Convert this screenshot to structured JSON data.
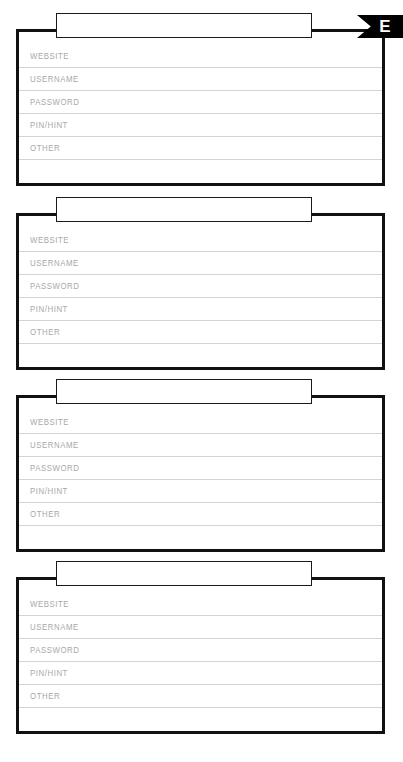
{
  "page": {
    "kind": "password-log-worksheet",
    "width": 403,
    "height": 762,
    "background_color": "#ffffff"
  },
  "index_tab": {
    "letter": "E",
    "background_color": "#000000",
    "text_color": "#ffffff",
    "shape": "left-notched-flag"
  },
  "style": {
    "card_border_color": "#111111",
    "row_separator_color": "#d4d4d4",
    "label_color": "#a8a8a8",
    "title_box_border_color": "#1a1a1a"
  },
  "field_labels": [
    "WEBSITE",
    "USERNAME",
    "PASSWORD",
    "PIN/HINT",
    "OTHER",
    ""
  ],
  "cards": [
    {
      "title": "",
      "top": 29,
      "title_box_top": 13,
      "fields": [
        {
          "label": "WEBSITE",
          "value": ""
        },
        {
          "label": "USERNAME",
          "value": ""
        },
        {
          "label": "PASSWORD",
          "value": ""
        },
        {
          "label": "PIN/HINT",
          "value": ""
        },
        {
          "label": "OTHER",
          "value": ""
        },
        {
          "label": "",
          "value": ""
        }
      ]
    },
    {
      "title": "",
      "top": 213,
      "title_box_top": 197,
      "fields": [
        {
          "label": "WEBSITE",
          "value": ""
        },
        {
          "label": "USERNAME",
          "value": ""
        },
        {
          "label": "PASSWORD",
          "value": ""
        },
        {
          "label": "PIN/HINT",
          "value": ""
        },
        {
          "label": "OTHER",
          "value": ""
        },
        {
          "label": "",
          "value": ""
        }
      ]
    },
    {
      "title": "",
      "top": 395,
      "title_box_top": 379,
      "fields": [
        {
          "label": "WEBSITE",
          "value": ""
        },
        {
          "label": "USERNAME",
          "value": ""
        },
        {
          "label": "PASSWORD",
          "value": ""
        },
        {
          "label": "PIN/HINT",
          "value": ""
        },
        {
          "label": "OTHER",
          "value": ""
        },
        {
          "label": "",
          "value": ""
        }
      ]
    },
    {
      "title": "",
      "top": 577,
      "title_box_top": 561,
      "fields": [
        {
          "label": "WEBSITE",
          "value": ""
        },
        {
          "label": "USERNAME",
          "value": ""
        },
        {
          "label": "PASSWORD",
          "value": ""
        },
        {
          "label": "PIN/HINT",
          "value": ""
        },
        {
          "label": "OTHER",
          "value": ""
        },
        {
          "label": "",
          "value": ""
        }
      ]
    }
  ]
}
